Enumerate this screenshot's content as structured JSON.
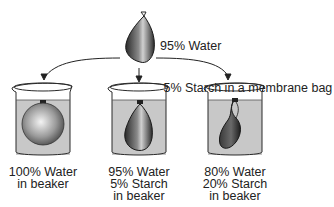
{
  "title_bag": {
    "line1": "95% Water",
    "line2": " 5% Starch in a membrane bag"
  },
  "beakers": [
    {
      "name": "beaker-pure-water",
      "bag_state": "swollen",
      "lines": [
        "100% Water",
        "in beaker"
      ]
    },
    {
      "name": "beaker-equal",
      "bag_state": "unchanged",
      "lines": [
        "95% Water",
        "5% Starch",
        "in beaker"
      ]
    },
    {
      "name": "beaker-hypertonic",
      "bag_state": "shrunken",
      "lines": [
        "80% Water",
        "20% Starch",
        "in beaker"
      ]
    }
  ],
  "colors": {
    "liquid": "#c8c8c8",
    "outline": "#2a2a2a",
    "bag_dark": "#3a3a3a"
  }
}
